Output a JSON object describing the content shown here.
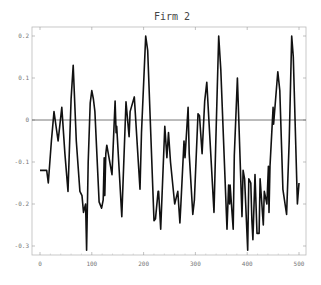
{
  "chart_data": {
    "type": "line",
    "title": "Firm 2",
    "xlabel": "",
    "ylabel": "",
    "xlim": [
      -5,
      510
    ],
    "ylim": [
      -0.32,
      0.22
    ],
    "xticks": [
      0,
      100,
      200,
      300,
      400,
      500
    ],
    "yticks": [
      -0.3,
      -0.2,
      -0.1,
      0,
      0.1,
      0.2
    ],
    "ytick_labels": [
      "-0.3",
      "-0.2",
      "-0.1",
      "0",
      "0.1",
      "0.2"
    ],
    "grid": false,
    "reference_line_y": 0,
    "series": [
      {
        "name": "Firm 2",
        "color": "#111111",
        "x": [
          0,
          13,
          16,
          22,
          27,
          35,
          42,
          48,
          54,
          60,
          64,
          70,
          77,
          81,
          84,
          88,
          90,
          93,
          97,
          100,
          103,
          106,
          114,
          119,
          122,
          124,
          125,
          127,
          129,
          139,
          145,
          147,
          148,
          158,
          166,
          172,
          174,
          182,
          193,
          196,
          204,
          208,
          220,
          223,
          228,
          229,
          233,
          241,
          245,
          248,
          252,
          260,
          266,
          270,
          272,
          278,
          280,
          286,
          288,
          295,
          298,
          305,
          308,
          313,
          318,
          322,
          336,
          339,
          345,
          349,
          361,
          364,
          366,
          367,
          373,
          375,
          381,
          390,
          392,
          395,
          401,
          403,
          407,
          409,
          411,
          415,
          419,
          423,
          425,
          431,
          433,
          438,
          441,
          442,
          444,
          450,
          451,
          459,
          463,
          469,
          476,
          481,
          486,
          489,
          497,
          500
        ],
        "y": [
          -0.12,
          -0.12,
          -0.15,
          -0.05,
          0.02,
          -0.05,
          0.03,
          -0.08,
          -0.17,
          0.05,
          0.13,
          -0.05,
          -0.17,
          -0.18,
          -0.22,
          -0.2,
          -0.31,
          -0.1,
          0.04,
          0.07,
          0.05,
          0.02,
          -0.195,
          -0.21,
          -0.19,
          -0.09,
          -0.18,
          -0.08,
          -0.06,
          -0.13,
          0.045,
          -0.03,
          -0.015,
          -0.23,
          0.043,
          -0.04,
          0.02,
          0.055,
          -0.165,
          -0.03,
          0.2,
          0.165,
          -0.24,
          -0.235,
          -0.17,
          -0.17,
          -0.26,
          -0.015,
          -0.09,
          -0.03,
          -0.1,
          -0.2,
          -0.17,
          -0.245,
          -0.2,
          -0.05,
          -0.09,
          0.03,
          -0.08,
          -0.225,
          -0.19,
          0.015,
          0.01,
          -0.08,
          0.045,
          0.09,
          -0.22,
          -0.07,
          0.2,
          0.12,
          -0.26,
          -0.155,
          -0.2,
          -0.155,
          -0.26,
          -0.085,
          0.1,
          -0.23,
          -0.12,
          -0.14,
          -0.31,
          -0.14,
          -0.15,
          -0.24,
          -0.285,
          -0.13,
          -0.27,
          -0.27,
          -0.14,
          -0.25,
          -0.17,
          -0.2,
          -0.11,
          -0.22,
          -0.11,
          0.03,
          -0.01,
          0.115,
          0.07,
          -0.165,
          -0.225,
          -0.05,
          0.2,
          0.15,
          -0.2,
          -0.15
        ]
      }
    ]
  }
}
